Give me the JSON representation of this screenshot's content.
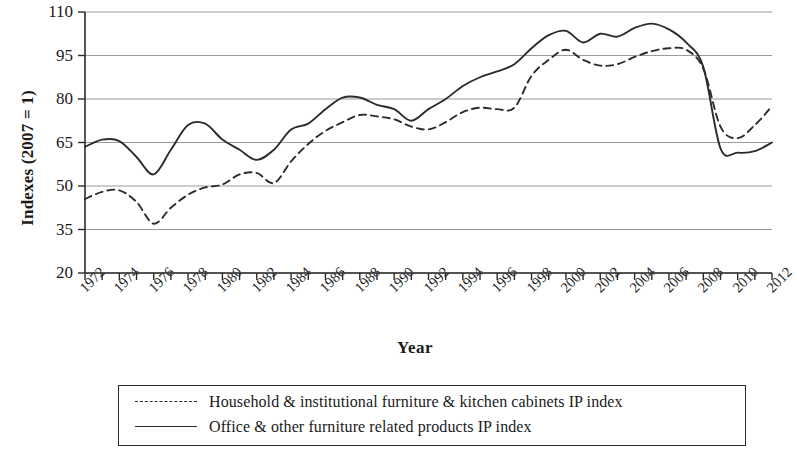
{
  "chart_data": {
    "type": "line",
    "title": "",
    "xlabel": "Year",
    "ylabel": "Indexes (2007 = 1)",
    "xlim": [
      1972,
      2012
    ],
    "ylim": [
      20,
      110
    ],
    "yticks": [
      20,
      35,
      50,
      65,
      80,
      95,
      110
    ],
    "grid": "horizontal",
    "legend_position": "below-plot",
    "x": [
      1972,
      1973,
      1974,
      1975,
      1976,
      1977,
      1978,
      1979,
      1980,
      1981,
      1982,
      1983,
      1984,
      1985,
      1986,
      1987,
      1988,
      1989,
      1990,
      1991,
      1992,
      1993,
      1994,
      1995,
      1996,
      1997,
      1998,
      1999,
      2000,
      2001,
      2002,
      2003,
      2004,
      2005,
      2006,
      2007,
      2008,
      2009,
      2010,
      2011,
      2012
    ],
    "xtick_labels": [
      "1972",
      "1974",
      "1976",
      "1978",
      "1980",
      "1982",
      "1984",
      "1986",
      "1988",
      "1990",
      "1992",
      "1994",
      "1996",
      "1998",
      "2000",
      "2002",
      "2004",
      "2006",
      "2008",
      "2010",
      "2012"
    ],
    "series": [
      {
        "name": "Household & institutional furniture & kitchen cabinets IP index",
        "style": "dashed",
        "color": "#2b2b2b",
        "values": [
          45.5,
          48.0,
          48.5,
          44.5,
          37.0,
          42.5,
          47.0,
          49.5,
          50.5,
          54.0,
          54.5,
          51.0,
          58.5,
          64.5,
          69.0,
          72.0,
          74.5,
          74.0,
          73.0,
          70.5,
          69.5,
          72.0,
          75.5,
          77.0,
          76.5,
          77.0,
          88.0,
          93.5,
          97.0,
          93.5,
          91.5,
          92.0,
          94.5,
          96.5,
          97.5,
          97.0,
          90.5,
          70.5,
          66.5,
          71.0,
          77.5
        ]
      },
      {
        "name": "Office & other furniture related products IP index",
        "style": "solid",
        "color": "#2b2b2b",
        "values": [
          63.5,
          66.0,
          65.5,
          60.0,
          54.0,
          62.5,
          71.0,
          71.5,
          66.0,
          62.5,
          59.0,
          62.5,
          69.5,
          71.5,
          76.5,
          80.5,
          80.5,
          78.0,
          76.5,
          72.5,
          76.5,
          80.0,
          84.5,
          87.5,
          89.5,
          92.0,
          97.5,
          102.0,
          103.5,
          99.5,
          102.5,
          101.5,
          104.5,
          106.0,
          104.0,
          99.5,
          91.0,
          63.0,
          61.5,
          62.0,
          65.0
        ]
      }
    ]
  },
  "legend": {
    "entries": [
      "Household & institutional furniture & kitchen cabinets IP index",
      "Office & other furniture related products IP index"
    ]
  }
}
